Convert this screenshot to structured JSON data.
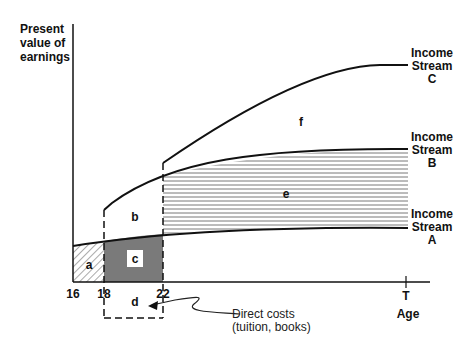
{
  "y_axis_label": [
    "Present",
    "value of",
    "earnings"
  ],
  "x_axis_label": "Age",
  "x_ticks": [
    "16",
    "18",
    "22",
    "T"
  ],
  "streams": [
    {
      "id": "C",
      "label": [
        "Income",
        "Stream",
        "C"
      ]
    },
    {
      "id": "B",
      "label": [
        "Income",
        "Stream",
        "B"
      ]
    },
    {
      "id": "A",
      "label": [
        "Income",
        "Stream",
        "A"
      ]
    }
  ],
  "regions": {
    "a": "a",
    "b": "b",
    "c": "c",
    "d": "d",
    "e": "e",
    "f": "f"
  },
  "annotation": [
    "Direct costs",
    "(tuition, books)"
  ]
}
